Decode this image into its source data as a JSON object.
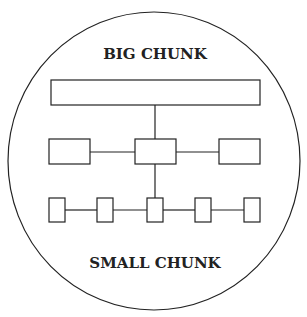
{
  "diagram": {
    "top_label": "BIG CHUNK",
    "bottom_label": "SMALL CHUNK",
    "stroke_color": "#222222",
    "levels": [
      {
        "name": "big",
        "boxes": 1
      },
      {
        "name": "medium",
        "boxes": 3
      },
      {
        "name": "small",
        "boxes": 5
      }
    ]
  }
}
